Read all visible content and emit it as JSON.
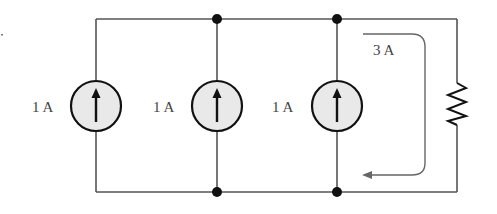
{
  "diagram": {
    "type": "circuit",
    "sources": [
      {
        "id": "source-1",
        "label": "1 A",
        "direction": "up"
      },
      {
        "id": "source-2",
        "label": "1 A",
        "direction": "up"
      },
      {
        "id": "source-3",
        "label": "1 A",
        "direction": "up"
      }
    ],
    "resistor": {
      "id": "resistor-1"
    },
    "current_annotation": {
      "label": "3 A",
      "direction": "clockwise-down-then-left"
    },
    "colors": {
      "wire": "#555555",
      "source_fill": "#e9e9e9",
      "source_outline": "#111111",
      "node": "#111111",
      "annotation": "#666666"
    }
  }
}
